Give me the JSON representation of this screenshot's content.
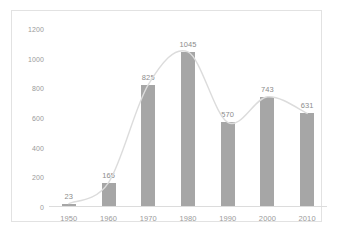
{
  "chart_data": {
    "type": "bar",
    "title": "",
    "subtitle": "",
    "xlabel": "",
    "ylabel": "",
    "categories": [
      "1950",
      "1960",
      "1970",
      "1980",
      "1990",
      "2000",
      "2010"
    ],
    "values": [
      23,
      165,
      825,
      1045,
      570,
      743,
      631
    ],
    "data_labels": [
      "23",
      "165",
      "825",
      "1045",
      "570",
      "743",
      "631"
    ],
    "ylim": [
      0,
      1200
    ],
    "ytick_labels": [
      "1200",
      "1000",
      "800",
      "600",
      "400",
      "200",
      "0"
    ],
    "ytick_values": [
      1200,
      1000,
      800,
      600,
      400,
      200,
      0
    ],
    "ytick_step": 200,
    "grid": false,
    "legend": false,
    "legend_position": "none",
    "overlay": {
      "type": "line",
      "style": "smoothed",
      "name": "trend",
      "values": [
        23,
        165,
        825,
        1045,
        570,
        743,
        631
      ],
      "color": "#dcdcdc"
    },
    "colors": {
      "bar": "#a6a6a6",
      "line": "#dcdcdc",
      "axis": "#dcdcdc",
      "tick_text": "#9a9a9a",
      "label_text": "#8c8c8c",
      "frame": "#e2e2e2",
      "background": "#ffffff"
    }
  }
}
